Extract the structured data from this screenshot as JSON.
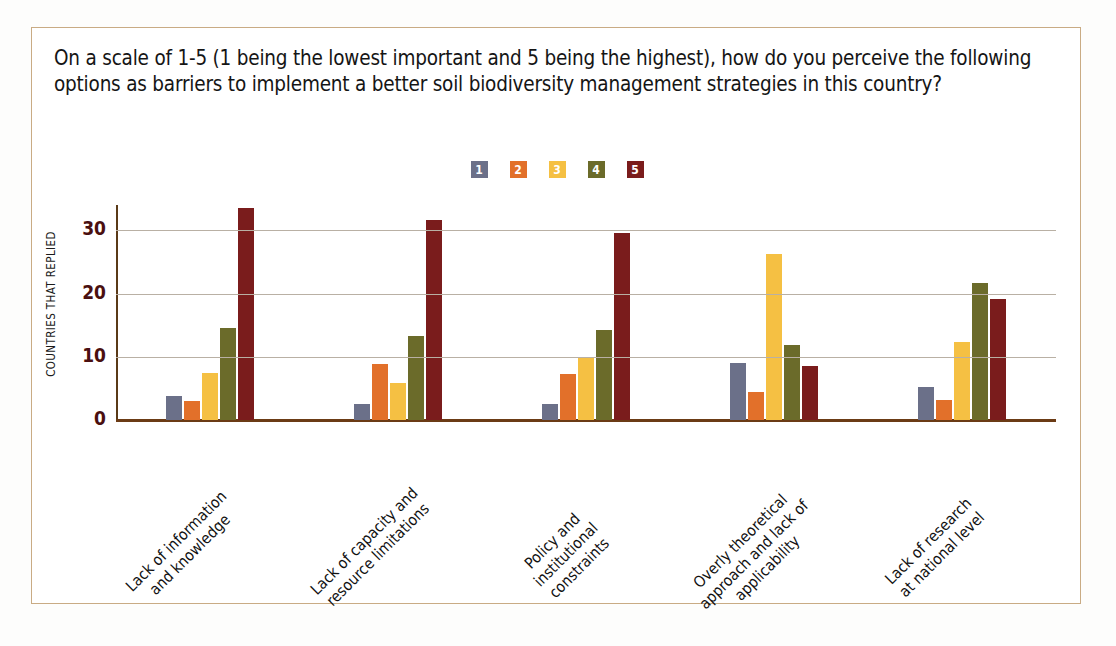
{
  "card": {
    "border_color": "#c9ab84"
  },
  "question": "On a scale of 1-5 (1 being the lowest important and 5 being the highest), how do you perceive the following options as barriers to implement a better soil biodiversity management strategies in this country?",
  "legend": {
    "position": "top-center",
    "entries": [
      {
        "label": "1",
        "color": "#6b7089"
      },
      {
        "label": "2",
        "color": "#e2702a"
      },
      {
        "label": "3",
        "color": "#f5c043"
      },
      {
        "label": "4",
        "color": "#6b6b2a"
      },
      {
        "label": "5",
        "color": "#7a1c1c"
      }
    ]
  },
  "chart_data": {
    "type": "bar",
    "title": "",
    "xlabel": "",
    "ylabel": "COUNTRIES THAT REPLIED",
    "ylim": [
      0,
      34
    ],
    "yticks": [
      0,
      10,
      20,
      30
    ],
    "grid": true,
    "categories": [
      "Lack of information\nand knowledge",
      "Lack of capacity and\nresource limitations",
      "Policy and\ninstitutional\nconstraints",
      "Overly theoretical\napproach and lack of\napplicability",
      "Lack of research\nat national level"
    ],
    "series": [
      {
        "name": "1",
        "color": "#6b7089",
        "values": [
          3.8,
          2.6,
          2.5,
          9.0,
          5.2
        ]
      },
      {
        "name": "2",
        "color": "#e2702a",
        "values": [
          3.0,
          8.8,
          7.3,
          4.5,
          3.2
        ]
      },
      {
        "name": "3",
        "color": "#f5c043",
        "values": [
          7.5,
          5.9,
          9.9,
          26.3,
          12.3
        ]
      },
      {
        "name": "4",
        "color": "#6b6b2a",
        "values": [
          14.6,
          13.3,
          14.3,
          11.9,
          21.7
        ]
      },
      {
        "name": "5",
        "color": "#7a1c1c",
        "values": [
          33.6,
          31.6,
          29.5,
          8.6,
          19.1
        ]
      }
    ]
  },
  "axis_style": {
    "gridline_color": "#b9b0a4",
    "baseline_color": "#6b3b15",
    "tick_text_color": "#4a0f10"
  }
}
